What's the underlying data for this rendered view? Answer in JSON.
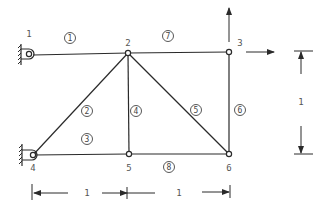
{
  "diagram": {
    "type": "truss",
    "nodes": [
      {
        "id": "1",
        "label": "1"
      },
      {
        "id": "2",
        "label": "2"
      },
      {
        "id": "3",
        "label": "3"
      },
      {
        "id": "4",
        "label": "4"
      },
      {
        "id": "5",
        "label": "5"
      },
      {
        "id": "6",
        "label": "6"
      }
    ],
    "members": [
      {
        "id": "1",
        "label": "1",
        "from": "1",
        "to": "2"
      },
      {
        "id": "2",
        "label": "2",
        "from": "4",
        "to": "2"
      },
      {
        "id": "3",
        "label": "3",
        "from": "4",
        "to": "5"
      },
      {
        "id": "4",
        "label": "4",
        "from": "5",
        "to": "2"
      },
      {
        "id": "5",
        "label": "5",
        "from": "2",
        "to": "6"
      },
      {
        "id": "6",
        "label": "6",
        "from": "3",
        "to": "6"
      },
      {
        "id": "7",
        "label": "7",
        "from": "2",
        "to": "3"
      },
      {
        "id": "8",
        "label": "8",
        "from": "5",
        "to": "6"
      }
    ],
    "supports": [
      {
        "node": "1",
        "type": "pin-wall"
      },
      {
        "node": "4",
        "type": "pin-wall"
      }
    ],
    "loads": [
      {
        "node": "3",
        "direction": "up"
      },
      {
        "node": "3",
        "direction": "right"
      }
    ],
    "dimensions": {
      "horizontal_left": "1",
      "horizontal_right": "1",
      "vertical": "1"
    }
  }
}
